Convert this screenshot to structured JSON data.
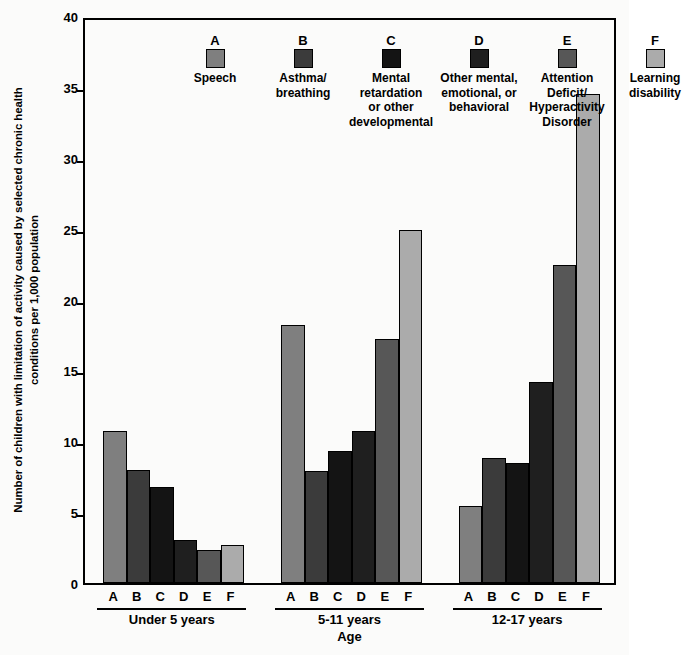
{
  "chart_data": {
    "type": "bar",
    "title": "",
    "xlabel": "Age",
    "ylabel": "Number of children with limitation of activity caused by selected chronic health conditions per 1,000 population",
    "ylabel_lines": [
      "Number of children with limitation of activity caused by selected chronic health",
      "conditions per 1,000 population"
    ],
    "ylim": [
      0,
      40
    ],
    "yticks": [
      0,
      5,
      10,
      15,
      20,
      25,
      30,
      35,
      40
    ],
    "grid": false,
    "legend_position": "inside-top",
    "categories": [
      "Under 5 years",
      "5-11 years",
      "12-17 years"
    ],
    "series": [
      {
        "key": "A",
        "name": "Speech",
        "color": "#7f7f7f",
        "values": [
          10.7,
          18.2,
          5.4
        ]
      },
      {
        "key": "B",
        "name": "Asthma/\nbreathing",
        "color": "#3b3b3b",
        "values": [
          8.0,
          7.9,
          8.8
        ]
      },
      {
        "key": "C",
        "name": "Mental\nretardation\nor other\ndevelopmental",
        "color": "#141414",
        "values": [
          6.8,
          9.3,
          8.5
        ]
      },
      {
        "key": "D",
        "name": "Other mental,\nemotional, or\nbehavioral",
        "color": "#1f1f1f",
        "values": [
          3.0,
          10.7,
          14.2
        ]
      },
      {
        "key": "E",
        "name": "Attention\nDeficit/\nHyperactivity\nDisorder",
        "color": "#575757",
        "values": [
          2.3,
          17.2,
          22.4
        ]
      },
      {
        "key": "F",
        "name": "Learning\ndisability",
        "color": "#ababab",
        "values": [
          2.7,
          24.9,
          34.5
        ]
      }
    ]
  },
  "legend": [
    {
      "key": "A",
      "label": "Speech",
      "color": "#7f7f7f"
    },
    {
      "key": "B",
      "label": "Asthma/\nbreathing",
      "color": "#3b3b3b"
    },
    {
      "key": "C",
      "label": "Mental\nretardation\nor other\ndevelopmental",
      "color": "#141414"
    },
    {
      "key": "D",
      "label": "Other mental,\nemotional, or\nbehavioral",
      "color": "#1f1f1f"
    },
    {
      "key": "E",
      "label": "Attention\nDeficit/\nHyperactivity\nDisorder",
      "color": "#575757"
    },
    {
      "key": "F",
      "label": "Learning\ndisability",
      "color": "#ababab"
    }
  ],
  "axis": {
    "x_title": "Age",
    "group_labels": [
      "Under 5 years",
      "5-11 years",
      "12-17 years"
    ],
    "series_letters": [
      "A",
      "B",
      "C",
      "D",
      "E",
      "F"
    ],
    "y_tick_labels": [
      "40",
      "35",
      "30",
      "25",
      "20",
      "15",
      "10",
      "5",
      "0"
    ]
  }
}
